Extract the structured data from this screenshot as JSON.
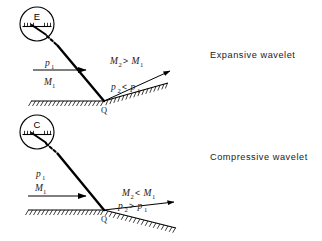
{
  "figure": {
    "title": "",
    "background_color": "#ffffff",
    "line_color": "#000000",
    "text_color": "#1a1a1a"
  },
  "panels": [
    {
      "id": "expansive",
      "side_label": "Expansive wavelet",
      "wave_source_symbol": "E",
      "incident_flow": {
        "pressure_label": "p",
        "pressure_sub": "1",
        "mach_label": "M",
        "mach_sub": "1"
      },
      "downstream_mach_relation": {
        "left": "M",
        "left_sub": "2",
        "operator": ">",
        "right": "M",
        "right_sub": "1"
      },
      "downstream_pressure_relation": {
        "left": "p",
        "left_sub": "2",
        "operator": "<",
        "right": "p",
        "right_sub": "1"
      },
      "reflection_point_label": "Q",
      "wall_deflection": "upward"
    },
    {
      "id": "compressive",
      "side_label": "Compressive wavelet",
      "wave_source_symbol": "C",
      "incident_flow": {
        "pressure_label": "p",
        "pressure_sub": "1",
        "mach_label": "M",
        "mach_sub": "1"
      },
      "downstream_mach_relation": {
        "left": "M",
        "left_sub": "2",
        "operator": "<",
        "right": "M",
        "right_sub": "1"
      },
      "downstream_pressure_relation": {
        "left": "p",
        "left_sub": "2",
        "operator": ">",
        "right": "p",
        "right_sub": "1"
      },
      "reflection_point_label": "Q",
      "wall_deflection": "downward"
    }
  ]
}
